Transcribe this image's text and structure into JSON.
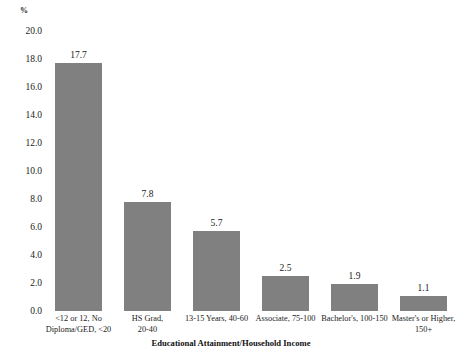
{
  "chart_data": {
    "type": "bar",
    "title": "",
    "xlabel": "Educational Attainment/Household Income",
    "ylabel": "%",
    "ylim": [
      0,
      20
    ],
    "ytick_step": 2.0,
    "grid": false,
    "legend": null,
    "bar_color": "#808080",
    "categories": [
      "<12 or 12, No\nDiploma/GED, <20",
      "HS Grad,\n20-40",
      "13-15 Years, 40-60",
      "Associate, 75-100",
      "Bachelor's, 100-150",
      "Master's or Higher,\n150+"
    ],
    "category_lines": [
      [
        "<12 or 12, No",
        "Diploma/GED, <20"
      ],
      [
        "HS Grad,",
        "20-40"
      ],
      [
        "13-15 Years, 40-60"
      ],
      [
        "Associate, 75-100"
      ],
      [
        "Bachelor's, 100-150"
      ],
      [
        "Master's or Higher,",
        "150+"
      ]
    ],
    "values": [
      17.7,
      7.8,
      5.7,
      2.5,
      1.9,
      1.1
    ],
    "value_labels": [
      "17.7",
      "7.8",
      "5.7",
      "2.5",
      "1.9",
      "1.1"
    ],
    "ytick_labels": [
      "20.0",
      "18.0",
      "16.0",
      "14.0",
      "12.0",
      "10.0",
      "8.0",
      "6.0",
      "4.0",
      "2.0",
      "0.0"
    ],
    "ytick_values": [
      20.0,
      18.0,
      16.0,
      14.0,
      12.0,
      10.0,
      8.0,
      6.0,
      4.0,
      2.0,
      0.0
    ]
  }
}
